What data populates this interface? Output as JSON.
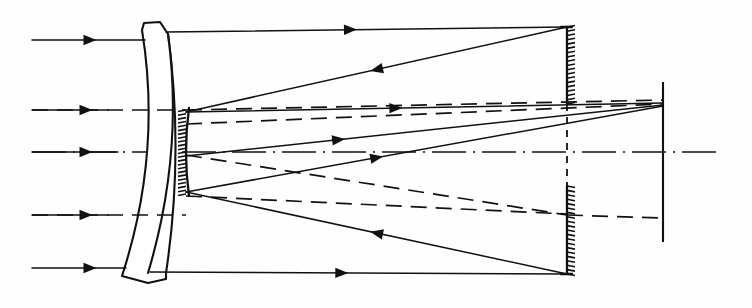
{
  "figure": {
    "type": "optical-ray-diagram",
    "background_color": "#fefefe",
    "ink_color": "#111111",
    "canvas": {
      "width": 752,
      "height": 308
    },
    "optical_axis_y": 152
  },
  "components": {
    "corrector": {
      "name": "corrector-plate",
      "description": "meniscus corrector lens, concave toward the right",
      "top_y": 30,
      "bottom_y": 276,
      "front_top_x": 142,
      "front_bottom_x": 122,
      "back_top_x": 166,
      "back_bottom_x": 148,
      "bulge_x": 20
    },
    "primary_mirror": {
      "name": "primary-mirror",
      "description": "concave primary mirror with hatched back, perforated at center",
      "x": 186,
      "top_y": 110,
      "bottom_y": 194,
      "hatch_count": 22,
      "hatch_length": 8,
      "hatch_side": "left"
    },
    "secondary_mirror": {
      "name": "secondary-mirror",
      "description": "convex secondary mirror, hatched on the right, split by the axis",
      "x": 567,
      "upper_top_y": 27,
      "upper_bottom_y": 104,
      "lower_top_y": 186,
      "lower_bottom_y": 274,
      "hatch_count_upper": 18,
      "hatch_count_lower": 20,
      "hatch_length": 8,
      "hatch_side": "right",
      "gap_dash_top_y": 104,
      "gap_dash_bottom_y": 186
    },
    "focal_plane": {
      "name": "focal-plane",
      "description": "image plane / detector line",
      "x": 663,
      "top_y": 82,
      "bottom_y": 242
    }
  },
  "rays": {
    "incoming_solid": [
      {
        "id": "marginal-upper",
        "y": 40,
        "x_start": 32,
        "x_end": 145,
        "arrow_x": 90
      },
      {
        "id": "zonal-upper",
        "y": 110,
        "x_start": 32,
        "x_end": 108,
        "arrow_x": 86
      },
      {
        "id": "axial",
        "y": 152,
        "x_start": 32,
        "x_end": 118,
        "arrow_x": 86
      },
      {
        "id": "zonal-lower",
        "y": 215,
        "x_start": 32,
        "x_end": 108,
        "arrow_x": 86
      },
      {
        "id": "marginal-lower",
        "y": 268,
        "x_start": 32,
        "x_end": 126,
        "arrow_x": 90
      }
    ],
    "solid_segments": [
      {
        "id": "top-to-secondary",
        "x1": 166,
        "y1": 32,
        "x2": 567,
        "y2": 27,
        "arrow_t": 0.46,
        "dir": "right"
      },
      {
        "id": "secondary-to-primary-upper",
        "x1": 567,
        "y1": 27,
        "x2": 186,
        "y2": 112,
        "arrow_t": 0.5,
        "dir": "left"
      },
      {
        "id": "primary-upper-to-focus",
        "x1": 186,
        "y1": 112,
        "x2": 663,
        "y2": 103,
        "arrow_t": 0.44,
        "dir": "right"
      },
      {
        "id": "bottom-to-secondary",
        "x1": 150,
        "y1": 272,
        "x2": 567,
        "y2": 274,
        "arrow_t": 0.46,
        "dir": "right"
      },
      {
        "id": "secondary-to-primary-lower",
        "x1": 567,
        "y1": 274,
        "x2": 186,
        "y2": 192,
        "arrow_t": 0.5,
        "dir": "left"
      },
      {
        "id": "primary-lower-to-focus",
        "x1": 186,
        "y1": 192,
        "x2": 663,
        "y2": 106,
        "arrow_t": 0.4,
        "dir": "right"
      },
      {
        "id": "primary-axis-to-focus",
        "x1": 186,
        "y1": 156,
        "x2": 663,
        "y2": 105,
        "arrow_t": 0.32,
        "dir": "right"
      }
    ],
    "dashed_segments": [
      {
        "id": "field-ray-1-in",
        "x1": 32,
        "y1": 110,
        "x2": 186,
        "y2": 110
      },
      {
        "id": "field-ray-2-in",
        "x1": 32,
        "y1": 215,
        "x2": 186,
        "y2": 215
      },
      {
        "id": "field-ray-1-out",
        "x1": 186,
        "y1": 110,
        "x2": 663,
        "y2": 100
      },
      {
        "id": "field-ray-2-out",
        "x1": 186,
        "y1": 124,
        "x2": 663,
        "y2": 104
      },
      {
        "id": "field-ray-3-out",
        "x1": 186,
        "y1": 155,
        "x2": 567,
        "y2": 215
      },
      {
        "id": "field-ray-4-out",
        "x1": 186,
        "y1": 196,
        "x2": 567,
        "y2": 214
      },
      {
        "id": "field-ray-5-out",
        "x1": 567,
        "y1": 215,
        "x2": 663,
        "y2": 218
      }
    ],
    "axis": {
      "x1": 32,
      "y1": 152,
      "x2": 720,
      "y2": 152
    }
  },
  "legend": {
    "solid_label": "marginal / axial rays",
    "dashed_label": "off-axis field rays"
  }
}
